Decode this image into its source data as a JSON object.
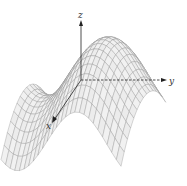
{
  "figure": {
    "type": "3d-wireframe-surface"
  },
  "axes": {
    "z": {
      "label": "z",
      "style": "solid",
      "direction": "up"
    },
    "y": {
      "label": "y",
      "style": "dashed-then-solid",
      "direction": "right"
    },
    "x": {
      "label": "x",
      "style": "solid",
      "direction": "toward-viewer"
    }
  },
  "colors": {
    "mesh": "#8a8a8a",
    "surface_fill": "#f1f1f1",
    "surface_shade": "#d6d6d6",
    "axis": "#222222",
    "background": "#ffffff"
  }
}
